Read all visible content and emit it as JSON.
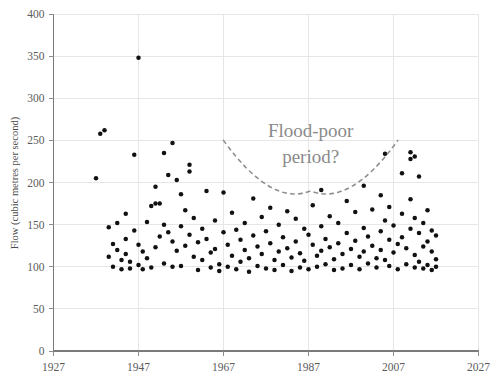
{
  "chart_data": {
    "type": "scatter",
    "title": "",
    "xlabel": "",
    "ylabel": "Flow (cubic metres per second)",
    "xlim": [
      1927,
      2027
    ],
    "ylim": [
      0,
      400
    ],
    "xticks": [
      1927,
      1947,
      1967,
      1987,
      2007,
      2027
    ],
    "yticks": [
      0,
      50,
      100,
      150,
      200,
      250,
      300,
      350,
      400
    ],
    "grid": true,
    "legend": false,
    "marker": "filled-circle",
    "marker_color": "#111111",
    "annotations": [
      {
        "text_line1": "Flood-poor",
        "text_line2": "period?",
        "color": "#8a8a8a",
        "shape": "dashed-u-curve",
        "x_span": [
          1967,
          2008
        ],
        "y_bottom": 190,
        "y_ends": 250
      }
    ],
    "points": [
      [
        1937,
        205
      ],
      [
        1938,
        258
      ],
      [
        1939,
        262
      ],
      [
        1940,
        147
      ],
      [
        1940,
        112
      ],
      [
        1941,
        127
      ],
      [
        1941,
        100
      ],
      [
        1942,
        152
      ],
      [
        1942,
        120
      ],
      [
        1943,
        108
      ],
      [
        1943,
        97
      ],
      [
        1944,
        163
      ],
      [
        1944,
        133
      ],
      [
        1944,
        115
      ],
      [
        1945,
        106
      ],
      [
        1945,
        98
      ],
      [
        1946,
        233
      ],
      [
        1946,
        143
      ],
      [
        1947,
        348
      ],
      [
        1947,
        126
      ],
      [
        1947,
        102
      ],
      [
        1948,
        118
      ],
      [
        1948,
        97
      ],
      [
        1949,
        153
      ],
      [
        1949,
        110
      ],
      [
        1950,
        172
      ],
      [
        1950,
        99
      ],
      [
        1951,
        195
      ],
      [
        1951,
        175
      ],
      [
        1951,
        123
      ],
      [
        1952,
        175
      ],
      [
        1952,
        136
      ],
      [
        1953,
        235
      ],
      [
        1953,
        150
      ],
      [
        1953,
        104
      ],
      [
        1954,
        209
      ],
      [
        1954,
        141
      ],
      [
        1955,
        247
      ],
      [
        1955,
        130
      ],
      [
        1955,
        100
      ],
      [
        1956,
        203
      ],
      [
        1956,
        119
      ],
      [
        1957,
        186
      ],
      [
        1957,
        148
      ],
      [
        1957,
        101
      ],
      [
        1958,
        167
      ],
      [
        1958,
        125
      ],
      [
        1959,
        221
      ],
      [
        1959,
        213
      ],
      [
        1959,
        138
      ],
      [
        1960,
        158
      ],
      [
        1960,
        112
      ],
      [
        1961,
        129
      ],
      [
        1961,
        96
      ],
      [
        1962,
        145
      ],
      [
        1962,
        108
      ],
      [
        1963,
        190
      ],
      [
        1963,
        133
      ],
      [
        1964,
        117
      ],
      [
        1964,
        99
      ],
      [
        1965,
        155
      ],
      [
        1965,
        121
      ],
      [
        1966,
        103
      ],
      [
        1966,
        95
      ],
      [
        1967,
        188
      ],
      [
        1967,
        141
      ],
      [
        1968,
        126
      ],
      [
        1968,
        100
      ],
      [
        1969,
        164
      ],
      [
        1969,
        113
      ],
      [
        1970,
        144
      ],
      [
        1970,
        97
      ],
      [
        1971,
        132
      ],
      [
        1971,
        106
      ],
      [
        1972,
        152
      ],
      [
        1972,
        120
      ],
      [
        1973,
        110
      ],
      [
        1973,
        94
      ],
      [
        1974,
        181
      ],
      [
        1974,
        137
      ],
      [
        1975,
        124
      ],
      [
        1975,
        101
      ],
      [
        1976,
        159
      ],
      [
        1976,
        115
      ],
      [
        1977,
        142
      ],
      [
        1977,
        98
      ],
      [
        1978,
        170
      ],
      [
        1978,
        128
      ],
      [
        1979,
        108
      ],
      [
        1979,
        96
      ],
      [
        1980,
        150
      ],
      [
        1980,
        118
      ],
      [
        1981,
        135
      ],
      [
        1981,
        102
      ],
      [
        1982,
        166
      ],
      [
        1982,
        122
      ],
      [
        1983,
        111
      ],
      [
        1983,
        95
      ],
      [
        1984,
        157
      ],
      [
        1984,
        130
      ],
      [
        1985,
        116
      ],
      [
        1985,
        99
      ],
      [
        1986,
        145
      ],
      [
        1986,
        107
      ],
      [
        1987,
        138
      ],
      [
        1987,
        97
      ],
      [
        1988,
        173
      ],
      [
        1988,
        126
      ],
      [
        1989,
        113
      ],
      [
        1989,
        100
      ],
      [
        1990,
        191
      ],
      [
        1990,
        148
      ],
      [
        1990,
        119
      ],
      [
        1991,
        133
      ],
      [
        1991,
        103
      ],
      [
        1992,
        160
      ],
      [
        1992,
        123
      ],
      [
        1993,
        109
      ],
      [
        1993,
        96
      ],
      [
        1994,
        152
      ],
      [
        1994,
        128
      ],
      [
        1995,
        115
      ],
      [
        1995,
        98
      ],
      [
        1996,
        178
      ],
      [
        1996,
        140
      ],
      [
        1997,
        121
      ],
      [
        1997,
        102
      ],
      [
        1998,
        165
      ],
      [
        1998,
        131
      ],
      [
        1999,
        112
      ],
      [
        1999,
        97
      ],
      [
        2000,
        196
      ],
      [
        2000,
        146
      ],
      [
        2000,
        118
      ],
      [
        2001,
        136
      ],
      [
        2001,
        104
      ],
      [
        2002,
        168
      ],
      [
        2002,
        125
      ],
      [
        2003,
        110
      ],
      [
        2003,
        99
      ],
      [
        2004,
        185
      ],
      [
        2004,
        142
      ],
      [
        2004,
        120
      ],
      [
        2005,
        234
      ],
      [
        2005,
        155
      ],
      [
        2005,
        108
      ],
      [
        2006,
        171
      ],
      [
        2006,
        132
      ],
      [
        2006,
        101
      ],
      [
        2007,
        149
      ],
      [
        2007,
        117
      ],
      [
        2008,
        127
      ],
      [
        2008,
        97
      ],
      [
        2009,
        211
      ],
      [
        2009,
        163
      ],
      [
        2009,
        135
      ],
      [
        2010,
        122
      ],
      [
        2010,
        103
      ],
      [
        2011,
        236
      ],
      [
        2011,
        228
      ],
      [
        2011,
        180
      ],
      [
        2011,
        145
      ],
      [
        2012,
        231
      ],
      [
        2012,
        158
      ],
      [
        2012,
        114
      ],
      [
        2012,
        99
      ],
      [
        2013,
        207
      ],
      [
        2013,
        140
      ],
      [
        2013,
        106
      ],
      [
        2014,
        152
      ],
      [
        2014,
        124
      ],
      [
        2014,
        98
      ],
      [
        2015,
        167
      ],
      [
        2015,
        130
      ],
      [
        2015,
        102
      ],
      [
        2016,
        143
      ],
      [
        2016,
        118
      ],
      [
        2016,
        96
      ],
      [
        2017,
        137
      ],
      [
        2017,
        109
      ],
      [
        2017,
        100
      ]
    ]
  }
}
